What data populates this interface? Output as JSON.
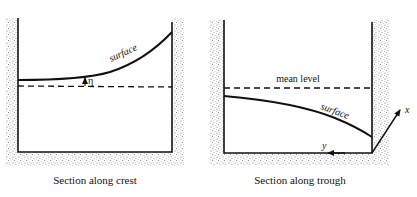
{
  "colors": {
    "ink": "#111111",
    "stipple": "#9a9a9a",
    "background": "#ffffff"
  },
  "left_panel": {
    "caption": "Section along crest",
    "surface_label": "surface",
    "eta_label": "η"
  },
  "right_panel": {
    "caption": "Section along trough",
    "mean_level_label": "mean level",
    "surface_label": "surface",
    "x_axis_label": "x",
    "y_axis_label": "y"
  }
}
